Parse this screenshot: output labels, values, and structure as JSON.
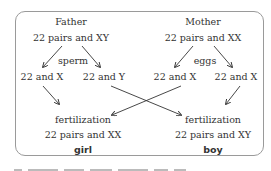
{
  "father": {
    "label": "Father",
    "genotype": "22 pairs and XY",
    "gamete_label": "sperm",
    "gametes": [
      "22 and X",
      "22 and Y"
    ]
  },
  "mother": {
    "label": "Mother",
    "genotype": "22 pairs and XX",
    "gamete_label": "eggs",
    "gametes": [
      "22 and X",
      "22 and X"
    ]
  },
  "outcomes": [
    {
      "process": "fertilization",
      "genotype": "22 pairs and XX",
      "sex": "girl"
    },
    {
      "process": "fertilization",
      "genotype": "22 pairs and XY",
      "sex": "boy"
    }
  ],
  "colors": {
    "text": "#333333",
    "border": "#9a9a9a",
    "arrow": "#333333"
  }
}
